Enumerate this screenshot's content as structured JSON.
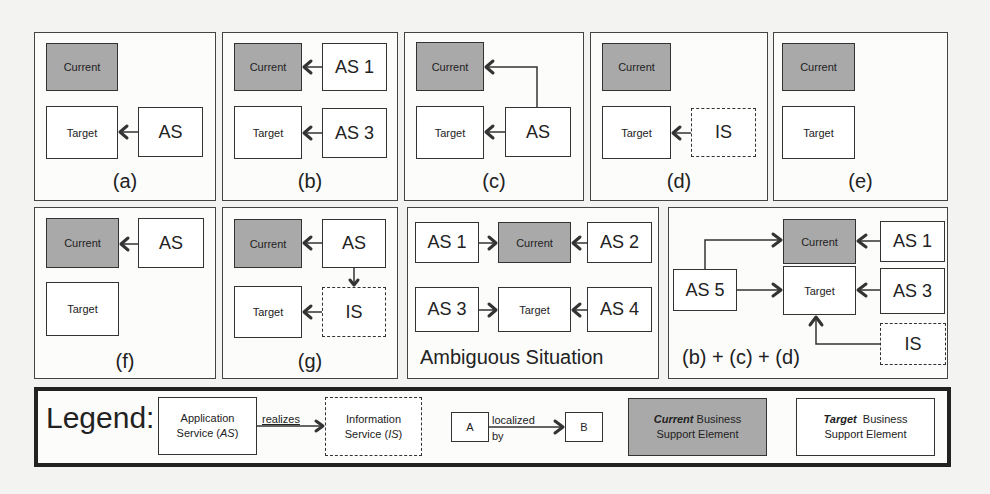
{
  "panels": {
    "a": {
      "label": "(a)",
      "current": "Current",
      "target": "Target",
      "as": "AS"
    },
    "b": {
      "label": "(b)",
      "current": "Current",
      "target": "Target",
      "as1": "AS 1",
      "as3": "AS 3"
    },
    "c": {
      "label": "(c)",
      "current": "Current",
      "target": "Target",
      "as": "AS"
    },
    "d": {
      "label": "(d)",
      "current": "Current",
      "target": "Target",
      "is": "IS"
    },
    "e": {
      "label": "(e)",
      "current": "Current",
      "target": "Target"
    },
    "f": {
      "label": "(f)",
      "current": "Current",
      "target": "Target",
      "as": "AS"
    },
    "g": {
      "label": "(g)",
      "current": "Current",
      "target": "Target",
      "as": "AS",
      "is": "IS"
    },
    "ambiguous": {
      "label": "Ambiguous Situation",
      "current": "Current",
      "target": "Target",
      "as1": "AS 1",
      "as2": "AS 2",
      "as3": "AS 3",
      "as4": "AS 4"
    },
    "combined": {
      "label": "(b) + (c) + (d)",
      "current": "Current",
      "target": "Target",
      "as1": "AS 1",
      "as3": "AS 3",
      "as5": "AS 5",
      "is": "IS"
    }
  },
  "legend": {
    "title": "Legend:",
    "app_service_line1": "Application",
    "app_service_line2": "Service (",
    "app_service_abbr": "AS",
    "info_service_line1": "Information",
    "info_service_line2": "Service (",
    "info_service_abbr": "IS",
    "close_paren": ")",
    "realizes": "realizes",
    "a": "A",
    "b": "B",
    "localized": "localized",
    "by": "by",
    "current_em": "Current",
    "current_rest": " Business",
    "current_line2": "Support Element",
    "target_em": "Target",
    "target_rest": "  Business",
    "target_line2": "Support Element"
  },
  "colors": {
    "current_fill": "#a9a9a9",
    "border": "#333333",
    "background": "#f3f3f1"
  }
}
